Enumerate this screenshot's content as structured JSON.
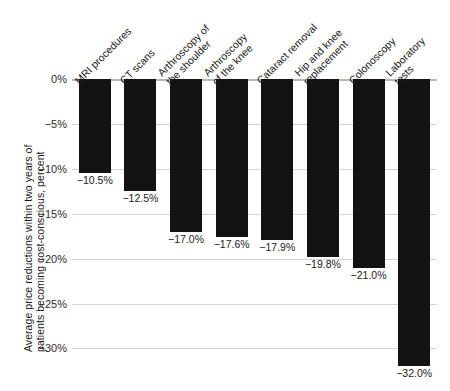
{
  "chart_data": {
    "type": "bar",
    "title": "",
    "subtitle": "",
    "xlabel": "",
    "ylabel_lines": [
      "Average price reductions within two years of",
      "patients becoming cost-conscious, percent"
    ],
    "ylabel": "Average price reductions within two years of patients becoming cost-conscious, percent",
    "categories": [
      "MRI procedures",
      "CT scans",
      "Arthroscopy of the shoulder",
      "Arthroscopy of the knee",
      "Cataract removal",
      "Hip and knee replacement",
      "Colonoscopy",
      "Laboratory tests"
    ],
    "category_lines": [
      [
        "MRI procedures"
      ],
      [
        "CT scans"
      ],
      [
        "Arthroscopy of",
        "the shoulder"
      ],
      [
        "Arthroscopy",
        "of the knee"
      ],
      [
        "Cataract removal"
      ],
      [
        "Hip and knee",
        "replacement"
      ],
      [
        "Colonoscopy"
      ],
      [
        "Laboratory",
        "tests"
      ]
    ],
    "values": [
      -10.5,
      -12.5,
      -17.0,
      -17.6,
      -17.9,
      -19.8,
      -21.0,
      -32.0
    ],
    "value_labels": [
      "−10.5%",
      "−12.5%",
      "−17.0%",
      "−17.6%",
      "−17.9%",
      "−19.8%",
      "−21.0%",
      "−32.0%"
    ],
    "ylim": [
      -30,
      0
    ],
    "y_axis_bottom": -30.4,
    "yticks": [
      0,
      -5,
      -10,
      -15,
      -20,
      -25,
      -30
    ],
    "ytick_labels": [
      "0%",
      "−5%",
      "−10%",
      "−15%",
      "−20%",
      "−25%",
      "−30%"
    ],
    "grid": true,
    "legend": "none",
    "bar_color": "#131313",
    "grid_color": "#d4d4d4",
    "axis_color": "#b8b8b8",
    "text_color": "#1a1a1a"
  }
}
